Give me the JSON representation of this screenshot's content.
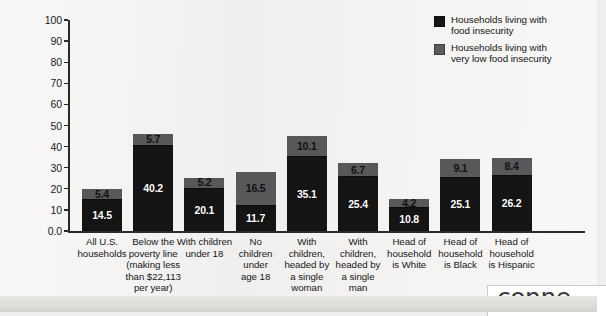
{
  "chart_data": {
    "type": "bar",
    "subtype": "stacked-vertical",
    "title": "",
    "xlabel": "",
    "ylabel": "Percent of households",
    "ylim": [
      0,
      100
    ],
    "yticks": [
      "0.0",
      "10",
      "20",
      "30",
      "40",
      "50",
      "60",
      "70",
      "80",
      "90",
      "100"
    ],
    "grid": false,
    "legend_position": "top-right",
    "categories": [
      "All U.S. households",
      "Below the poverty line (making less than $22,113 per year)",
      "With children under 18",
      "No children under age 18",
      "With children, headed by a single woman",
      "With children, headed by a single man",
      "Head of household is White",
      "Head of household is Black",
      "Head of household is Hispanic"
    ],
    "series": [
      {
        "name": "Households living with food insecurity",
        "color": "#141414",
        "values": [
          14.5,
          40.2,
          20.1,
          11.7,
          35.1,
          25.4,
          10.8,
          25.1,
          26.2
        ]
      },
      {
        "name": "Households living with very low food insecurity",
        "color": "#57585a",
        "values": [
          5.4,
          5.7,
          5.2,
          16.5,
          10.1,
          6.7,
          4.2,
          9.1,
          8.4
        ]
      }
    ],
    "totals": [
      19.9,
      45.9,
      25.3,
      28.2,
      45.2,
      32.1,
      15.0,
      34.2,
      34.6
    ]
  },
  "axis": {
    "y_label": "Percent of households",
    "y_ticks": [
      "100",
      "90",
      "80",
      "70",
      "60",
      "50",
      "40",
      "30",
      "20",
      "10",
      "0.0"
    ]
  },
  "categories": [
    {
      "lines": [
        "All U.S.",
        "households"
      ]
    },
    {
      "lines": [
        "Below the",
        "poverty line",
        "(making less",
        "than $22,113",
        "per year)"
      ]
    },
    {
      "lines": [
        "With children",
        "under 18"
      ]
    },
    {
      "lines": [
        "No",
        "children",
        "under",
        "age 18"
      ]
    },
    {
      "lines": [
        "With",
        "children,",
        "headed by",
        "a single",
        "woman"
      ]
    },
    {
      "lines": [
        "With",
        "children,",
        "headed by",
        "a single",
        "man"
      ]
    },
    {
      "lines": [
        "Head of",
        "household",
        "is White"
      ]
    },
    {
      "lines": [
        "Head of",
        "household",
        "is Black"
      ]
    },
    {
      "lines": [
        "Head of",
        "household",
        "is Hispanic"
      ]
    }
  ],
  "bars": [
    {
      "low": "14.5",
      "verylow": "5.4"
    },
    {
      "low": "40.2",
      "verylow": "5.7"
    },
    {
      "low": "20.1",
      "verylow": "5.2"
    },
    {
      "low": "11.7",
      "verylow": "16.5"
    },
    {
      "low": "35.1",
      "verylow": "10.1"
    },
    {
      "low": "25.4",
      "verylow": "6.7"
    },
    {
      "low": "10.8",
      "verylow": "4.2"
    },
    {
      "low": "25.1",
      "verylow": "9.1"
    },
    {
      "low": "26.2",
      "verylow": "8.4"
    }
  ],
  "legend": {
    "items": [
      {
        "label_line1": "Households living with",
        "label_line2": "food insecurity",
        "color": "#151515"
      },
      {
        "label_line1": "Households living with",
        "label_line2": "very low food insecurity",
        "color": "#5a5b5d"
      }
    ]
  },
  "watermark": {
    "text": "conne"
  }
}
